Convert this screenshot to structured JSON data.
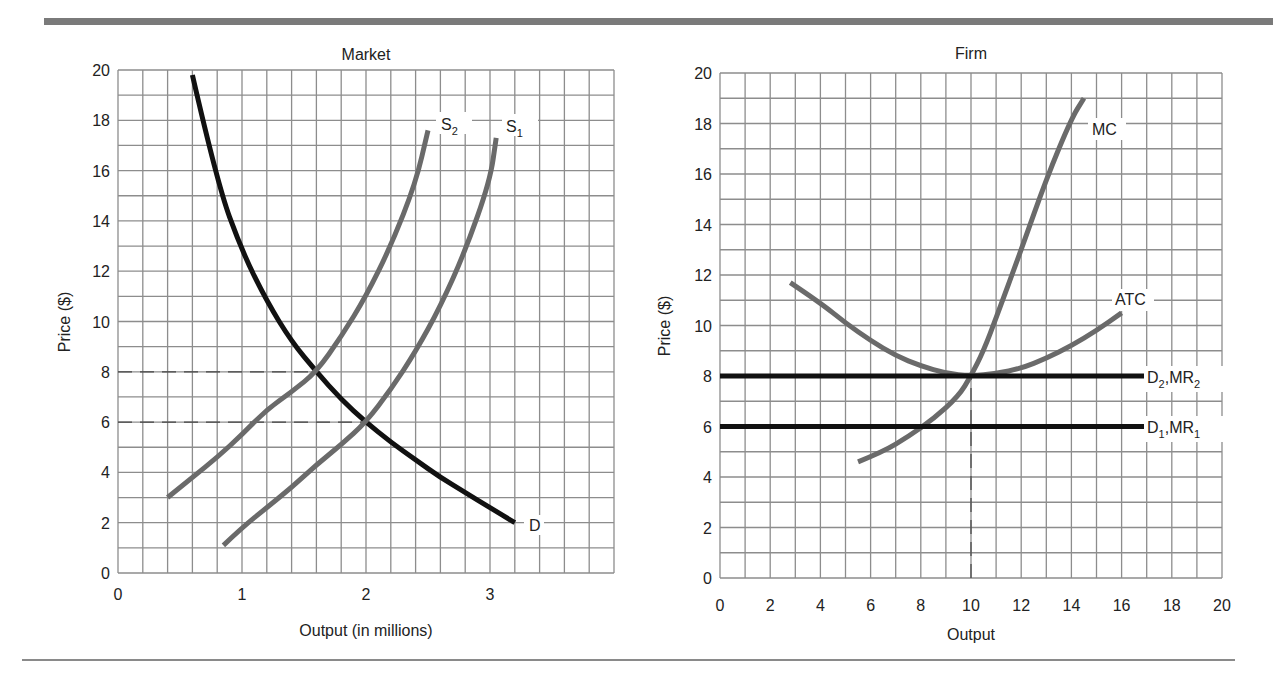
{
  "chart_data": [
    {
      "type": "line",
      "title": "Market",
      "xlabel": "Output (in millions)",
      "ylabel": "Price ($)",
      "xlim": [
        0,
        4
      ],
      "ylim": [
        0,
        20
      ],
      "x_ticks": [
        "0",
        "1",
        "2",
        "3"
      ],
      "y_ticks": [
        "0",
        "2",
        "4",
        "6",
        "8",
        "10",
        "12",
        "14",
        "16",
        "18",
        "20"
      ],
      "grid": true,
      "series": [
        {
          "name": "D",
          "color": "#111111",
          "points": [
            [
              0.6,
              19.8
            ],
            [
              0.8,
              15.5
            ],
            [
              1.0,
              12.8
            ],
            [
              1.2,
              10.8
            ],
            [
              1.4,
              9.2
            ],
            [
              1.6,
              8.0
            ],
            [
              1.8,
              6.9
            ],
            [
              2.0,
              6.0
            ],
            [
              2.2,
              5.2
            ],
            [
              2.4,
              4.5
            ],
            [
              2.6,
              3.8
            ],
            [
              2.8,
              3.2
            ],
            [
              3.0,
              2.6
            ],
            [
              3.2,
              2.0
            ]
          ]
        },
        {
          "name": "S2",
          "color": "#6a6a6a",
          "points": [
            [
              0.4,
              3.0
            ],
            [
              0.6,
              3.8
            ],
            [
              0.8,
              4.6
            ],
            [
              1.0,
              5.5
            ],
            [
              1.2,
              6.5
            ],
            [
              1.4,
              7.2
            ],
            [
              1.6,
              8.0
            ],
            [
              1.8,
              9.4
            ],
            [
              2.0,
              11.0
            ],
            [
              2.2,
              13.0
            ],
            [
              2.4,
              15.5
            ],
            [
              2.5,
              17.6
            ]
          ]
        },
        {
          "name": "S1",
          "color": "#6a6a6a",
          "points": [
            [
              0.85,
              1.1
            ],
            [
              1.0,
              1.8
            ],
            [
              1.2,
              2.6
            ],
            [
              1.4,
              3.4
            ],
            [
              1.6,
              4.3
            ],
            [
              1.8,
              5.1
            ],
            [
              2.0,
              6.0
            ],
            [
              2.2,
              7.3
            ],
            [
              2.4,
              8.8
            ],
            [
              2.6,
              10.6
            ],
            [
              2.8,
              12.8
            ],
            [
              3.0,
              15.6
            ],
            [
              3.05,
              17.3
            ]
          ]
        },
        {
          "name": "P=8 reference",
          "style": "dashed",
          "points": [
            [
              0,
              8
            ],
            [
              1.6,
              8
            ]
          ]
        },
        {
          "name": "P=6 reference",
          "style": "dashed",
          "points": [
            [
              0,
              6
            ],
            [
              2.0,
              6
            ]
          ]
        }
      ],
      "annotations": [
        "S2",
        "S1",
        "D"
      ]
    },
    {
      "type": "line",
      "title": "Firm",
      "xlabel": "Output",
      "ylabel": "Price ($)",
      "xlim": [
        0,
        20
      ],
      "ylim": [
        0,
        20
      ],
      "x_ticks": [
        "0",
        "2",
        "4",
        "6",
        "8",
        "10",
        "12",
        "14",
        "16",
        "18",
        "20"
      ],
      "y_ticks": [
        "0",
        "2",
        "4",
        "6",
        "8",
        "10",
        "12",
        "14",
        "16",
        "18",
        "20"
      ],
      "grid": true,
      "series": [
        {
          "name": "MC",
          "color": "#6a6a6a",
          "points": [
            [
              5.5,
              4.6
            ],
            [
              6.5,
              5.0
            ],
            [
              7.5,
              5.6
            ],
            [
              8.5,
              6.3
            ],
            [
              9.5,
              7.2
            ],
            [
              10,
              8.0
            ],
            [
              10.5,
              9.0
            ],
            [
              11,
              10.3
            ],
            [
              12,
              13.0
            ],
            [
              13,
              15.8
            ],
            [
              14,
              18.2
            ],
            [
              14.5,
              19.0
            ]
          ]
        },
        {
          "name": "ATC",
          "color": "#6a6a6a",
          "points": [
            [
              2.8,
              11.7
            ],
            [
              4,
              10.9
            ],
            [
              5,
              10.1
            ],
            [
              6,
              9.4
            ],
            [
              7,
              8.8
            ],
            [
              8,
              8.4
            ],
            [
              9,
              8.1
            ],
            [
              10,
              8.0
            ],
            [
              11,
              8.1
            ],
            [
              12,
              8.3
            ],
            [
              13,
              8.7
            ],
            [
              14,
              9.2
            ],
            [
              15,
              9.8
            ],
            [
              16,
              10.5
            ]
          ]
        },
        {
          "name": "D2,MR2",
          "color": "#111111",
          "points": [
            [
              0,
              8
            ],
            [
              17,
              8
            ]
          ]
        },
        {
          "name": "D1,MR1",
          "color": "#111111",
          "points": [
            [
              0,
              6
            ],
            [
              17,
              6
            ]
          ]
        },
        {
          "name": "Q=10 reference",
          "style": "dashed",
          "points": [
            [
              10,
              0
            ],
            [
              10,
              8
            ]
          ]
        }
      ],
      "annotations": [
        "MC",
        "ATC",
        "D2,MR2",
        "D1,MR1"
      ]
    }
  ],
  "labels": {
    "market": {
      "title": "Market",
      "xlabel": "Output (in millions)",
      "ylabel": "Price ($)",
      "s2_main": "S",
      "s2_sub": "2",
      "s1_main": "S",
      "s1_sub": "1",
      "d": "D"
    },
    "firm": {
      "title": "Firm",
      "xlabel": "Output",
      "ylabel": "Price ($)",
      "mc": "MC",
      "atc": "ATC",
      "d2_a": "D",
      "d2_a_sub": "2",
      "d2_b": ",MR",
      "d2_b_sub": "2",
      "d1_a": "D",
      "d1_a_sub": "1",
      "d1_b": ",MR",
      "d1_b_sub": "1"
    }
  }
}
